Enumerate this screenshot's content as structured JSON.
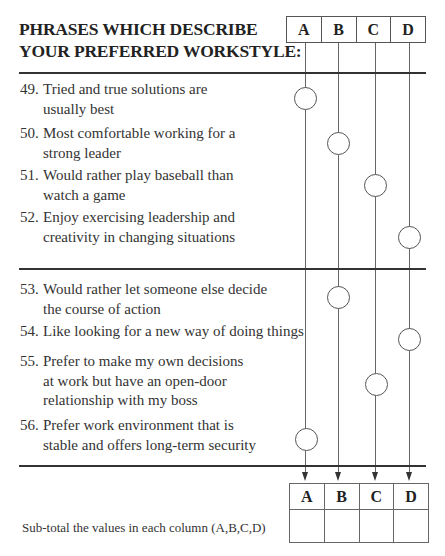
{
  "title": {
    "line1": "PHRASES WHICH DESCRIBE",
    "line2": "YOUR PREFERRED WORKSTYLE:"
  },
  "columns": [
    "A",
    "B",
    "C",
    "D"
  ],
  "items": [
    {
      "number": "49.",
      "text": "Tried and true solutions are usually best",
      "column": "A"
    },
    {
      "number": "50.",
      "text": "Most comfortable working for a strong leader",
      "column": "B"
    },
    {
      "number": "51.",
      "text": "Would rather play baseball than watch a game",
      "column": "C"
    },
    {
      "number": "52.",
      "text": "Enjoy exercising leadership and creativity in changing situations",
      "column": "D"
    },
    {
      "number": "53.",
      "text": "Would rather let someone else decide the course of action",
      "column": "B"
    },
    {
      "number": "54.",
      "text": "Like looking for a new way of doing things",
      "column": "D"
    },
    {
      "number": "55.",
      "text": "Prefer to make my own decisions at work but have an open-door relationship with my boss",
      "column": "C"
    },
    {
      "number": "56.",
      "text": "Prefer work environment that is stable and offers long-term security",
      "column": "A"
    }
  ],
  "subtotal": {
    "label": "Sub-total the values in each column (A,B,C,D)",
    "columns": [
      "A",
      "B",
      "C",
      "D"
    ],
    "values": [
      "",
      "",
      "",
      ""
    ]
  }
}
